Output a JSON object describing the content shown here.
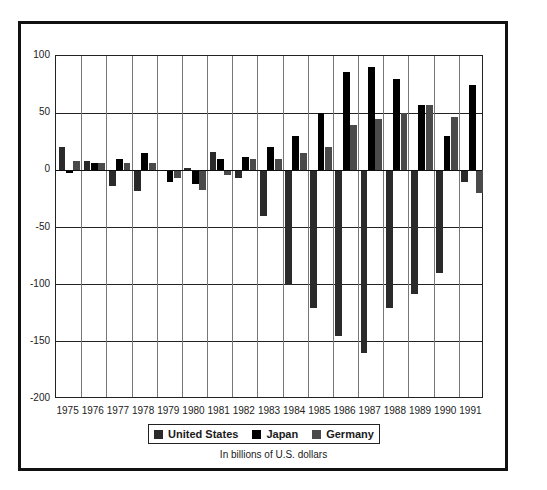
{
  "chart_data": {
    "type": "bar",
    "title": "",
    "xlabel": "",
    "ylabel": "",
    "caption": "In billions of U.S. dollars",
    "ylim": [
      -200,
      100
    ],
    "yticks": [
      100,
      50,
      0,
      -50,
      -100,
      -150,
      -200
    ],
    "grid": true,
    "legend_position": "bottom",
    "categories": [
      "1975",
      "1976",
      "1977",
      "1978",
      "1979",
      "1980",
      "1981",
      "1982",
      "1983",
      "1984",
      "1985",
      "1986",
      "1987",
      "1988",
      "1989",
      "1990",
      "1991"
    ],
    "series": [
      {
        "name": "United States",
        "color": "#2a2a2a",
        "values": [
          20,
          8,
          -14,
          -18,
          -1,
          2,
          16,
          -7,
          -40,
          -100,
          -120,
          -145,
          -160,
          -120,
          -108,
          -90,
          -10
        ]
      },
      {
        "name": "Japan",
        "color": "#000000",
        "values": [
          -2,
          6,
          10,
          15,
          -10,
          -12,
          10,
          12,
          20,
          30,
          50,
          86,
          90,
          80,
          57,
          30,
          75
        ]
      },
      {
        "name": "Germany",
        "color": "#4a4a4a",
        "values": [
          8,
          6,
          6,
          6,
          -7,
          -17,
          -4,
          10,
          10,
          15,
          20,
          40,
          45,
          50,
          57,
          47,
          -20
        ]
      }
    ]
  },
  "legend": {
    "items": [
      {
        "label": "United States",
        "color": "#2a2a2a"
      },
      {
        "label": "Japan",
        "color": "#000000"
      },
      {
        "label": "Germany",
        "color": "#4a4a4a"
      }
    ]
  },
  "caption": "In billions of U.S. dollars"
}
